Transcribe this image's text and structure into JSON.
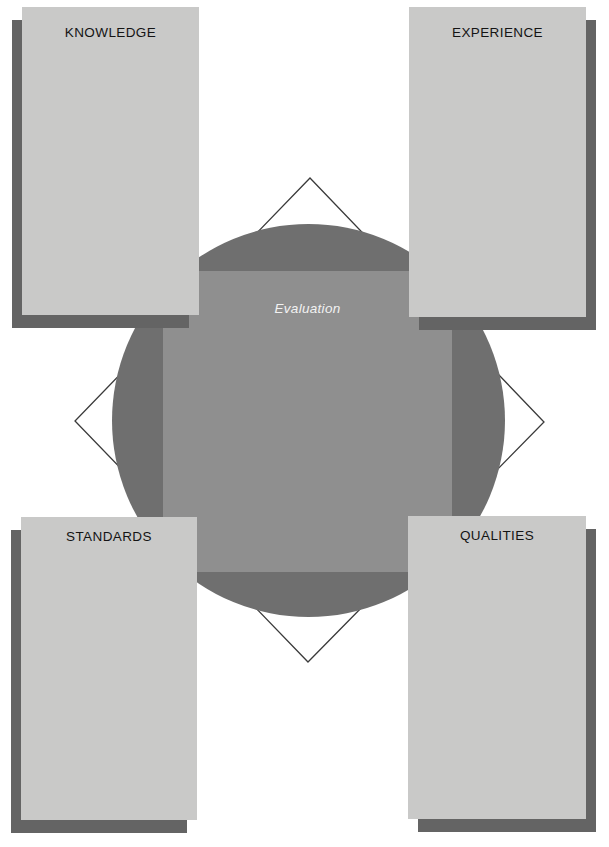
{
  "panels": [
    {
      "label": "KNOWLEDGE",
      "position": "top-left"
    },
    {
      "label": "EXPERIENCE",
      "position": "top-right"
    },
    {
      "label": "STANDARDS",
      "position": "bottom-left"
    },
    {
      "label": "QUALITIES",
      "position": "bottom-right"
    }
  ],
  "center": {
    "label": "Evaluation"
  },
  "colors": {
    "background": "#ffffff",
    "panel": "#c9c9c8",
    "shadow": "#646464",
    "circle": "#6f6f6f",
    "square": "#8f8f8f",
    "outline": "#3a3a3a",
    "label_text": "#141414",
    "center_text": "#f2f2f2"
  }
}
